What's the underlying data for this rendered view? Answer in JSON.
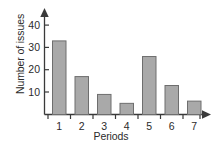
{
  "chart_data": {
    "type": "bar",
    "title": "",
    "xlabel": "Periods",
    "ylabel": "Number of issues",
    "categories": [
      "1",
      "2",
      "3",
      "4",
      "5",
      "6",
      "7"
    ],
    "values": [
      33,
      17,
      9,
      5,
      26,
      13,
      6
    ],
    "ylim": [
      0,
      45
    ],
    "yticks": [
      10,
      20,
      30,
      40
    ],
    "ytick_labels": [
      "10",
      "20",
      "30",
      "40"
    ],
    "grid": false,
    "legend": null,
    "bar_color": "#a9a9a9",
    "bar_edge_color": "#6e6e6e",
    "axis_color": "#3a3a3a"
  },
  "axes": {
    "y_tick_0": "10",
    "y_tick_1": "20",
    "y_tick_2": "30",
    "y_tick_3": "40",
    "x_tick_0": "1",
    "x_tick_1": "2",
    "x_tick_2": "3",
    "x_tick_3": "4",
    "x_tick_4": "5",
    "x_tick_5": "6",
    "x_tick_6": "7"
  }
}
